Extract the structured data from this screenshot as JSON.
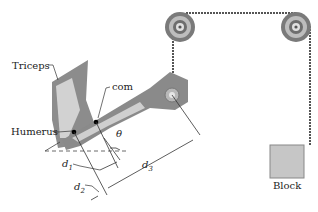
{
  "diagram": {
    "labels": {
      "triceps": "Triceps",
      "com": "com",
      "humerus": "Humerus",
      "theta": "θ",
      "block": "Block"
    },
    "dimensions": {
      "d1": {
        "base": "d",
        "sub": "1"
      },
      "d2": {
        "base": "d",
        "sub": "2"
      },
      "d3": {
        "base": "d",
        "sub": "3"
      }
    },
    "colors": {
      "arm": "#8a8a8a",
      "arm_highlight": "#cfcfcf",
      "rope": "#555555",
      "pulley": "#6e6e6e",
      "block": "#c4c4c4",
      "lines": "#333333"
    }
  }
}
